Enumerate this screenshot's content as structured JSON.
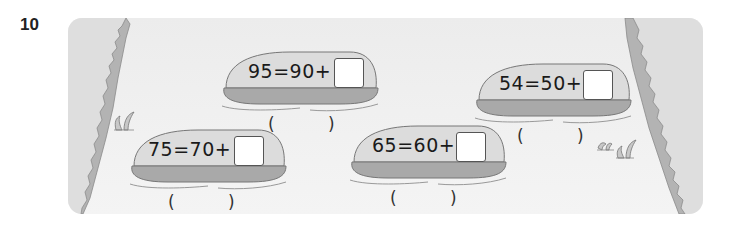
{
  "question": {
    "number": "10"
  },
  "stones": [
    {
      "id": "stone-1",
      "equation": "95=90+",
      "answer_box": "",
      "paren_open": "(",
      "paren_close": ")"
    },
    {
      "id": "stone-2",
      "equation": "54=50+",
      "answer_box": "",
      "paren_open": "(",
      "paren_close": ")"
    },
    {
      "id": "stone-3",
      "equation": "75=70+",
      "answer_box": "",
      "paren_open": "(",
      "paren_close": ")"
    },
    {
      "id": "stone-4",
      "equation": "65=60+",
      "answer_box": "",
      "paren_open": "(",
      "paren_close": ")"
    }
  ],
  "colors": {
    "stone_top": "#dcdcdc",
    "stone_side": "#a9a9a9",
    "bank": "#bdbdbd",
    "panel": "#eeeeee"
  }
}
